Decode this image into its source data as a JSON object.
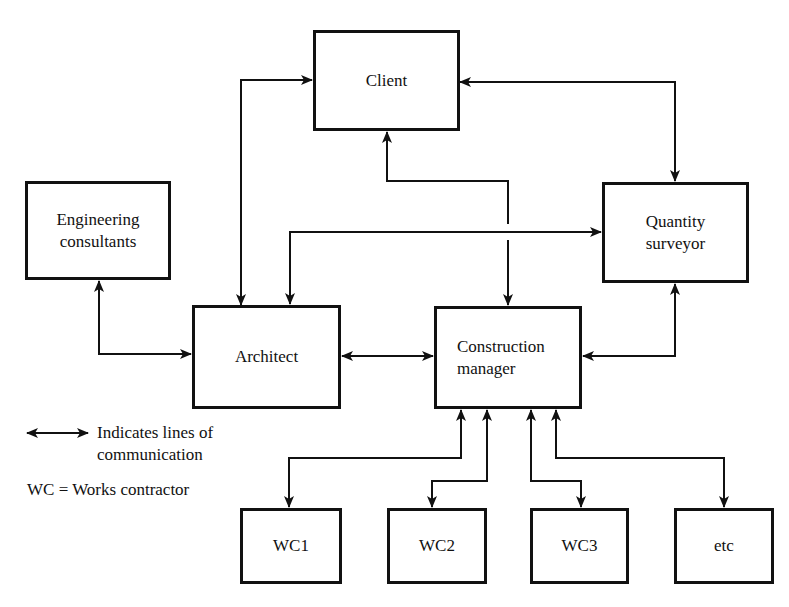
{
  "diagram": {
    "type": "organization-communication-chart",
    "nodes": {
      "client": {
        "label": "Client"
      },
      "engineering_consultants": {
        "line1": "Engineering",
        "line2": "consultants"
      },
      "quantity_surveyor": {
        "line1": "Quantity",
        "line2": "surveyor"
      },
      "architect": {
        "label": "Architect"
      },
      "construction_manager": {
        "line1": "Construction",
        "line2": "manager"
      },
      "wc1": {
        "label": "WC1"
      },
      "wc2": {
        "label": "WC2"
      },
      "wc3": {
        "label": "WC3"
      },
      "etc": {
        "label": "etc"
      }
    },
    "edges": [
      {
        "from": "Client",
        "to": "Architect",
        "type": "bidirectional"
      },
      {
        "from": "Client",
        "to": "Quantity surveyor",
        "type": "bidirectional"
      },
      {
        "from": "Client",
        "to": "Construction manager",
        "type": "bidirectional"
      },
      {
        "from": "Architect",
        "to": "Quantity surveyor",
        "type": "bidirectional"
      },
      {
        "from": "Engineering consultants",
        "to": "Architect",
        "type": "bidirectional"
      },
      {
        "from": "Architect",
        "to": "Construction manager",
        "type": "bidirectional"
      },
      {
        "from": "Quantity surveyor",
        "to": "Construction manager",
        "type": "bidirectional"
      },
      {
        "from": "Construction manager",
        "to": "WC1",
        "type": "bidirectional"
      },
      {
        "from": "Construction manager",
        "to": "WC2",
        "type": "bidirectional"
      },
      {
        "from": "Construction manager",
        "to": "WC3",
        "type": "bidirectional"
      },
      {
        "from": "Construction manager",
        "to": "etc",
        "type": "bidirectional"
      }
    ],
    "legend": {
      "arrow_line1": "Indicates lines of",
      "arrow_line2": "communication",
      "abbreviation": "WC = Works contractor"
    }
  }
}
